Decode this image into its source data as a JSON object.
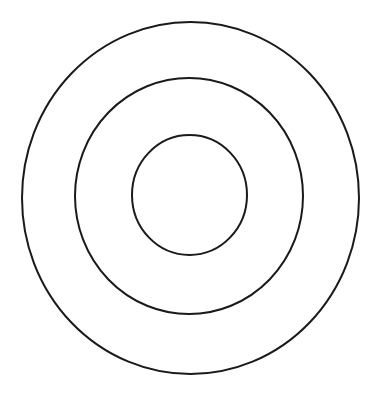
{
  "diagram": {
    "type": "concentric-circles",
    "background": "#ffffff",
    "stroke_color": "#1a1a1a",
    "stroke_width": 2,
    "rings": [
      {
        "name": "outer",
        "cx": 190.5,
        "cy": 198,
        "rx": 168.5,
        "ry": 176
      },
      {
        "name": "middle",
        "cx": 189,
        "cy": 196,
        "rx": 114,
        "ry": 118
      },
      {
        "name": "inner",
        "cx": 189.5,
        "cy": 195,
        "rx": 57.5,
        "ry": 60
      }
    ]
  }
}
